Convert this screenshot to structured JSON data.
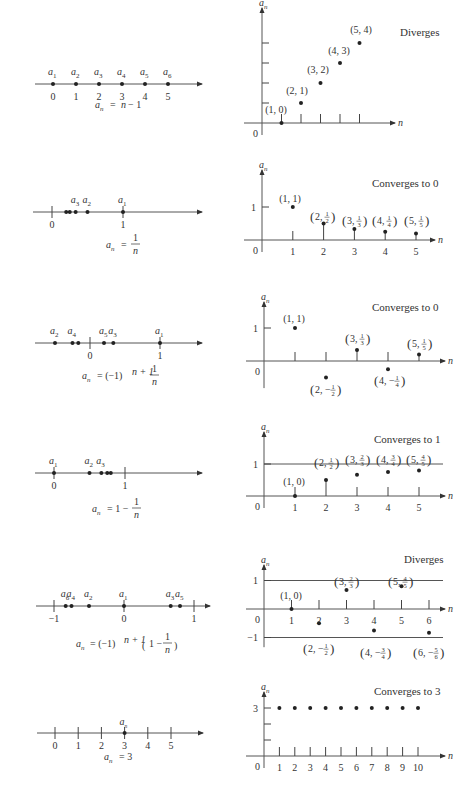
{
  "chart_data": [
    {
      "type": "scatter",
      "formula": "a_n = n - 1",
      "title": "Diverges",
      "xlabel": "n",
      "ylabel": "a_n",
      "number_line": {
        "ticks": [
          0,
          1,
          2,
          3,
          4,
          5
        ],
        "points": [
          {
            "label": "a1",
            "value": 0
          },
          {
            "label": "a2",
            "value": 1
          },
          {
            "label": "a3",
            "value": 2
          },
          {
            "label": "a4",
            "value": 3
          },
          {
            "label": "a5",
            "value": 4
          },
          {
            "label": "a6",
            "value": 5
          }
        ]
      },
      "x": [
        1,
        2,
        3,
        4,
        5
      ],
      "values": [
        0,
        1,
        2,
        3,
        4
      ],
      "point_labels": [
        "(1, 0)",
        "(2, 1)",
        "(3, 2)",
        "(4, 3)",
        "(5, 4)"
      ],
      "xlim": [
        0,
        5.5
      ],
      "ylim": [
        0,
        4.5
      ],
      "grid": false
    },
    {
      "type": "scatter",
      "formula": "a_n = 1/n",
      "title": "Converges to 0",
      "xlabel": "n",
      "ylabel": "a_n",
      "number_line": {
        "ticks": [
          0,
          1
        ],
        "points": [
          {
            "label": "a1",
            "value": 1
          },
          {
            "label": "a2",
            "value": 0.5
          },
          {
            "label": "a3",
            "value": 0.333
          },
          {
            "label": "",
            "value": 0.25
          },
          {
            "label": "",
            "value": 0.2
          }
        ]
      },
      "x": [
        1,
        2,
        3,
        4,
        5
      ],
      "values": [
        1,
        0.5,
        0.333,
        0.25,
        0.2
      ],
      "point_labels": [
        "(1, 1)",
        "(2, 1/2)",
        "(3, 1/3)",
        "(4, 1/4)",
        "(5, 1/5)"
      ],
      "y_ticks": [
        1
      ],
      "xlim": [
        0,
        5.5
      ],
      "ylim": [
        0,
        1.3
      ],
      "grid": false
    },
    {
      "type": "scatter",
      "formula": "a_n = (-1)^(n+1) 1/n",
      "title": "Converges to 0",
      "xlabel": "n",
      "ylabel": "a_n",
      "number_line": {
        "ticks": [
          0,
          1
        ],
        "points": [
          {
            "label": "a1",
            "value": 1
          },
          {
            "label": "a2",
            "value": -0.5
          },
          {
            "label": "a3",
            "value": 0.333
          },
          {
            "label": "a4",
            "value": -0.25
          },
          {
            "label": "a5",
            "value": 0.2
          },
          {
            "label": "",
            "value": -0.167
          }
        ]
      },
      "x": [
        1,
        2,
        3,
        4,
        5
      ],
      "values": [
        1,
        -0.5,
        0.333,
        -0.25,
        0.2
      ],
      "point_labels": [
        "(1, 1)",
        "(2, -1/2)",
        "(3, 1/3)",
        "(4, -1/4)",
        "(5, 1/5)"
      ],
      "y_ticks": [
        1
      ],
      "xlim": [
        0,
        5.5
      ],
      "ylim": [
        -0.7,
        1.3
      ],
      "grid": false
    },
    {
      "type": "scatter",
      "formula": "a_n = 1 - 1/n",
      "title": "Converges to 1",
      "xlabel": "n",
      "ylabel": "a_n",
      "number_line": {
        "ticks": [
          0,
          1
        ],
        "points": [
          {
            "label": "a1",
            "value": 0
          },
          {
            "label": "a2",
            "value": 0.5
          },
          {
            "label": "a3",
            "value": 0.667
          },
          {
            "label": "",
            "value": 0.75
          },
          {
            "label": "",
            "value": 0.8
          }
        ]
      },
      "x": [
        1,
        2,
        3,
        4,
        5
      ],
      "values": [
        0,
        0.5,
        0.667,
        0.75,
        0.8
      ],
      "point_labels": [
        "(1, 0)",
        "(2, 1/2)",
        "(3, 2/3)",
        "(4, 3/4)",
        "(5, 4/5)"
      ],
      "y_ticks": [
        1
      ],
      "reference_line": 1,
      "xlim": [
        0,
        5.5
      ],
      "ylim": [
        0,
        1.3
      ],
      "grid": false
    },
    {
      "type": "scatter",
      "formula": "a_n = (-1)^(n+1) (1 - 1/n)",
      "title": "Diverges",
      "xlabel": "n",
      "ylabel": "a_n",
      "number_line": {
        "ticks": [
          -1,
          0,
          1
        ],
        "points": [
          {
            "label": "a1",
            "value": 0
          },
          {
            "label": "a2",
            "value": -0.5
          },
          {
            "label": "a3",
            "value": 0.667
          },
          {
            "label": "a4",
            "value": -0.75
          },
          {
            "label": "a5",
            "value": 0.8
          },
          {
            "label": "a6",
            "value": -0.833
          }
        ]
      },
      "x": [
        1,
        2,
        3,
        4,
        5,
        6
      ],
      "values": [
        0,
        -0.5,
        0.667,
        -0.75,
        0.8,
        -0.833
      ],
      "point_labels": [
        "(1, 0)",
        "(2, -1/2)",
        "(3, 2/3)",
        "(4, -3/4)",
        "(5, 4/5)",
        "(6, -5/6)"
      ],
      "y_ticks": [
        1,
        -1
      ],
      "reference_lines": [
        1,
        -1
      ],
      "xlim": [
        0,
        6.5
      ],
      "ylim": [
        -1.2,
        1.3
      ],
      "grid": false
    },
    {
      "type": "scatter",
      "formula": "a_n = 3",
      "title": "Converges to 3",
      "xlabel": "n",
      "ylabel": "a_n",
      "number_line": {
        "ticks": [
          0,
          1,
          2,
          3,
          4,
          5
        ],
        "points": [
          {
            "label": "a_n",
            "value": 3
          }
        ]
      },
      "x": [
        1,
        2,
        3,
        4,
        5,
        6,
        7,
        8,
        9,
        10
      ],
      "values": [
        3,
        3,
        3,
        3,
        3,
        3,
        3,
        3,
        3,
        3
      ],
      "y_ticks": [
        3
      ],
      "xlim": [
        0,
        10.5
      ],
      "ylim": [
        0,
        3.5
      ],
      "grid": false
    }
  ],
  "text": {
    "titles": [
      "Diverges",
      "Converges to 0",
      "Converges to 0",
      "Converges to 1",
      "Diverges",
      "Converges to 3"
    ],
    "axis_y": "a",
    "axis_y_sub": "n",
    "axis_x": "n",
    "origin": "0"
  }
}
